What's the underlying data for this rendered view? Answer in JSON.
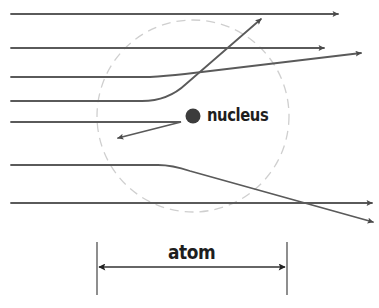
{
  "diagram": {
    "labels": {
      "nucleus": "nucleus",
      "atom": "atom"
    },
    "colors": {
      "path": "#5a5a5a",
      "nucleus": "#3c3c3c",
      "atom_boundary": "#cfcfcf",
      "text": "#1e1e1e",
      "background": "#ffffff"
    },
    "atom_boundary": {
      "shape": "dashed-circle",
      "cx": 193,
      "cy": 116,
      "r": 96
    },
    "nucleus": {
      "shape": "filled-circle",
      "cx": 193,
      "cy": 116,
      "r": 7
    },
    "paths": [
      {
        "id": "path-1",
        "behavior": "undeflected",
        "start": [
          11,
          14
        ],
        "end": [
          338,
          14
        ]
      },
      {
        "id": "path-2",
        "behavior": "undeflected",
        "start": [
          11,
          48
        ],
        "end": [
          324,
          48
        ]
      },
      {
        "id": "path-3",
        "behavior": "slightly-deflected-up",
        "start": [
          11,
          77
        ],
        "end": [
          361,
          53
        ]
      },
      {
        "id": "path-4",
        "behavior": "strongly-deflected-up",
        "start": [
          11,
          101
        ],
        "end": [
          261,
          19
        ]
      },
      {
        "id": "path-5",
        "behavior": "back-scattered",
        "start": [
          11,
          122
        ],
        "turn": [
          181,
          122
        ],
        "end": [
          118,
          138
        ]
      },
      {
        "id": "path-6",
        "behavior": "deflected-down",
        "start": [
          11,
          165
        ],
        "end": [
          373,
          222
        ]
      },
      {
        "id": "path-7",
        "behavior": "undeflected",
        "start": [
          11,
          203
        ],
        "end": [
          372,
          203
        ]
      }
    ],
    "dimension": {
      "label": "atom",
      "left_x": 97,
      "right_x": 287,
      "y": 267,
      "tick_top": 242,
      "tick_bottom": 295
    }
  }
}
